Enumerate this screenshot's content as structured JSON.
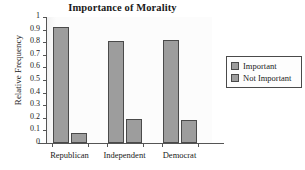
{
  "chart_data": {
    "type": "bar",
    "title": "Importance of Morality",
    "xlabel": "",
    "ylabel": "Relative Frequency",
    "categories": [
      "Republican",
      "Independent",
      "Democrat"
    ],
    "series": [
      {
        "name": "Important",
        "values": [
          0.92,
          0.81,
          0.82
        ]
      },
      {
        "name": "Not Important",
        "values": [
          0.08,
          0.19,
          0.18
        ]
      }
    ],
    "ylim": [
      0,
      1
    ],
    "yticks": [
      "0",
      "0.1",
      "0.2",
      "0.3",
      "0.4",
      "0.5",
      "0.6",
      "0.7",
      "0.8",
      "0.9",
      "1"
    ],
    "grid": false,
    "legend_position": "right",
    "colors": {
      "bar_fill": "#9d9d9d",
      "bar_edge": "#4a4a4a",
      "plot_background": "#fbfbfb",
      "axis": "#555555",
      "text": "#1a1a1a"
    }
  }
}
